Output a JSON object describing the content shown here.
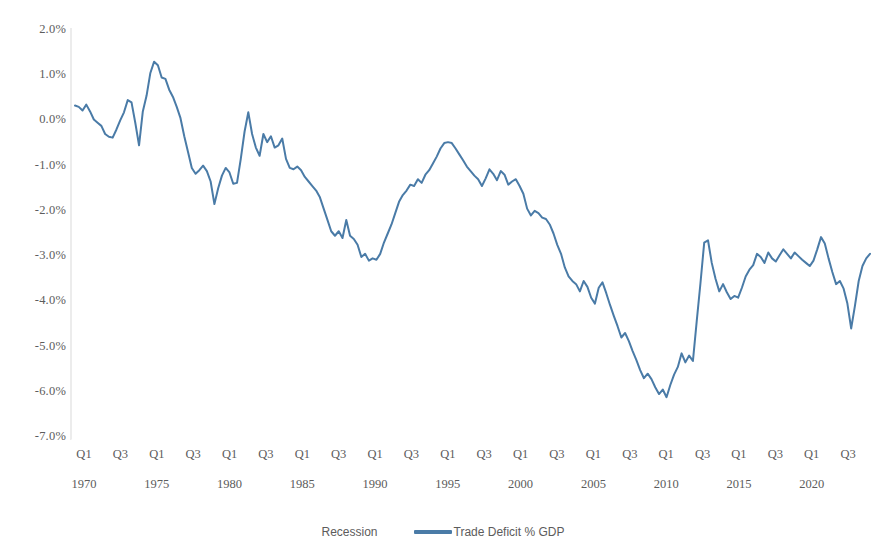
{
  "chart_data": {
    "type": "line",
    "title": "",
    "subtitle": "",
    "xlabel": "",
    "ylabel": "",
    "ylim": [
      -7.0,
      2.0
    ],
    "ytick_values": [
      2.0,
      1.0,
      0.0,
      -1.0,
      -2.0,
      -3.0,
      -4.0,
      -5.0,
      -6.0,
      -7.0
    ],
    "ytick_labels": [
      "2.0%",
      "1.0%",
      "0.0%",
      "-1.0%",
      "-2.0%",
      "-3.0%",
      "-4.0%",
      "-5.0%",
      "-6.0%",
      "-7.0%"
    ],
    "grid": false,
    "legend_position": "bottom",
    "x_quarter_labels": [
      "Q1",
      "Q3",
      "Q1",
      "Q3",
      "Q1",
      "Q3",
      "Q1",
      "Q3",
      "Q1",
      "Q3",
      "Q1",
      "Q3",
      "Q1",
      "Q3",
      "Q1",
      "Q3",
      "Q1",
      "Q3",
      "Q1",
      "Q3",
      "Q1",
      "Q3"
    ],
    "x_year_labels": [
      "1970",
      "1975",
      "1980",
      "1985",
      "1990",
      "1995",
      "2000",
      "2005",
      "2010",
      "2015",
      "2020"
    ],
    "x_start": "1970 Q1",
    "x_end": "2022 Q4",
    "series": [
      {
        "name": "Recession",
        "color": "#ffffff",
        "marker": "none",
        "values": []
      },
      {
        "name": "Trade Deficit % GDP",
        "color": "#4a7ba7",
        "marker": "line",
        "values": [
          0.33,
          0.3,
          0.22,
          0.35,
          0.2,
          0.02,
          -0.05,
          -0.12,
          -0.3,
          -0.36,
          -0.38,
          -0.2,
          0.0,
          0.18,
          0.45,
          0.4,
          -0.05,
          -0.55,
          0.2,
          0.55,
          1.05,
          1.3,
          1.22,
          0.95,
          0.92,
          0.68,
          0.52,
          0.3,
          0.05,
          -0.35,
          -0.7,
          -1.05,
          -1.18,
          -1.1,
          -1.0,
          -1.12,
          -1.35,
          -1.85,
          -1.5,
          -1.22,
          -1.05,
          -1.15,
          -1.4,
          -1.38,
          -0.85,
          -0.25,
          0.18,
          -0.3,
          -0.6,
          -0.78,
          -0.3,
          -0.48,
          -0.35,
          -0.6,
          -0.55,
          -0.4,
          -0.85,
          -1.05,
          -1.08,
          -1.02,
          -1.1,
          -1.25,
          -1.35,
          -1.45,
          -1.55,
          -1.7,
          -1.95,
          -2.2,
          -2.45,
          -2.55,
          -2.45,
          -2.6,
          -2.2,
          -2.55,
          -2.62,
          -2.75,
          -3.02,
          -2.95,
          -3.1,
          -3.05,
          -3.08,
          -2.95,
          -2.7,
          -2.5,
          -2.3,
          -2.05,
          -1.8,
          -1.65,
          -1.55,
          -1.42,
          -1.45,
          -1.3,
          -1.38,
          -1.2,
          -1.1,
          -0.95,
          -0.8,
          -0.62,
          -0.5,
          -0.48,
          -0.5,
          -0.62,
          -0.75,
          -0.88,
          -1.02,
          -1.12,
          -1.22,
          -1.3,
          -1.45,
          -1.28,
          -1.08,
          -1.18,
          -1.32,
          -1.12,
          -1.2,
          -1.42,
          -1.35,
          -1.3,
          -1.45,
          -1.62,
          -1.95,
          -2.1,
          -2.0,
          -2.05,
          -2.15,
          -2.18,
          -2.3,
          -2.5,
          -2.75,
          -2.95,
          -3.25,
          -3.45,
          -3.55,
          -3.62,
          -3.78,
          -3.55,
          -3.68,
          -3.92,
          -4.05,
          -3.7,
          -3.58,
          -3.82,
          -4.08,
          -4.32,
          -4.55,
          -4.8,
          -4.7,
          -4.88,
          -5.1,
          -5.3,
          -5.52,
          -5.7,
          -5.6,
          -5.72,
          -5.9,
          -6.05,
          -5.95,
          -6.12,
          -5.85,
          -5.62,
          -5.45,
          -5.15,
          -5.35,
          -5.2,
          -5.32,
          -4.45,
          -3.6,
          -2.7,
          -2.65,
          -3.15,
          -3.5,
          -3.78,
          -3.62,
          -3.8,
          -3.95,
          -3.88,
          -3.92,
          -3.7,
          -3.45,
          -3.3,
          -3.2,
          -2.95,
          -3.02,
          -3.15,
          -2.92,
          -3.05,
          -3.12,
          -2.98,
          -2.85,
          -2.95,
          -3.05,
          -2.92,
          -3.0,
          -3.08,
          -3.15,
          -3.22,
          -3.1,
          -2.85,
          -2.58,
          -2.72,
          -3.05,
          -3.35,
          -3.62,
          -3.55,
          -3.72,
          -4.05,
          -4.6,
          -4.1,
          -3.55,
          -3.22,
          -3.05,
          -2.95
        ]
      }
    ]
  },
  "legend": {
    "items": [
      {
        "label": "Recession",
        "swatch": "none"
      },
      {
        "label": "Trade Deficit % GDP",
        "swatch": "line"
      }
    ]
  }
}
